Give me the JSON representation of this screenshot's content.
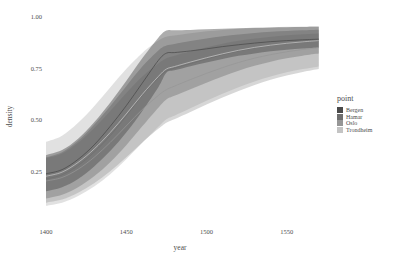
{
  "chart_data": {
    "type": "area",
    "title": "",
    "xlabel": "year",
    "ylabel": "density",
    "xlim": [
      1400,
      1572
    ],
    "ylim": [
      0.04,
      1.02
    ],
    "xticks": [
      1400,
      1450,
      1500,
      1550
    ],
    "xticklabels": [
      "1400",
      "1450",
      "1500",
      "1550"
    ],
    "yticks": [
      0.25,
      0.5,
      0.75,
      1.0
    ],
    "yticklabels": [
      "0.25",
      "0.50",
      "0.75",
      "1.00"
    ],
    "grid": false,
    "legend": {
      "title": "point",
      "position": "right",
      "entries": [
        {
          "label": "Bergen",
          "color": "#4a4a4a"
        },
        {
          "label": "Hamar",
          "color": "#6e6e6e"
        },
        {
          "label": "Oslo",
          "color": "#969696"
        },
        {
          "label": "Trondheim",
          "color": "#c4c4c4"
        }
      ]
    },
    "x": [
      1400,
      1410,
      1420,
      1430,
      1440,
      1450,
      1460,
      1470,
      1475,
      1480,
      1490,
      1500,
      1510,
      1520,
      1530,
      1540,
      1550,
      1560,
      1570
    ],
    "series": [
      {
        "name": "Bergen",
        "color": "#4a4a4a",
        "band_alpha": 0.45,
        "median": [
          0.24,
          0.26,
          0.31,
          0.38,
          0.47,
          0.57,
          0.68,
          0.79,
          0.825,
          0.828,
          0.836,
          0.846,
          0.857,
          0.866,
          0.874,
          0.881,
          0.886,
          0.89,
          0.893
        ],
        "lower": [
          0.155,
          0.175,
          0.215,
          0.275,
          0.35,
          0.44,
          0.545,
          0.66,
          0.73,
          0.742,
          0.762,
          0.78,
          0.797,
          0.812,
          0.824,
          0.834,
          0.842,
          0.848,
          0.853
        ],
        "upper": [
          0.33,
          0.355,
          0.41,
          0.49,
          0.585,
          0.69,
          0.8,
          0.9,
          0.935,
          0.936,
          0.938,
          0.941,
          0.944,
          0.946,
          0.948,
          0.95,
          0.951,
          0.952,
          0.953
        ]
      },
      {
        "name": "Hamar",
        "color": "#6e6e6e",
        "band_alpha": 0.4,
        "median": [
          0.215,
          0.235,
          0.28,
          0.345,
          0.425,
          0.52,
          0.62,
          0.705,
          0.738,
          0.752,
          0.775,
          0.797,
          0.818,
          0.836,
          0.851,
          0.863,
          0.872,
          0.879,
          0.885
        ],
        "lower": [
          0.12,
          0.138,
          0.175,
          0.228,
          0.296,
          0.378,
          0.47,
          0.56,
          0.6,
          0.618,
          0.65,
          0.682,
          0.712,
          0.74,
          0.764,
          0.784,
          0.8,
          0.813,
          0.823
        ],
        "upper": [
          0.32,
          0.345,
          0.4,
          0.478,
          0.568,
          0.665,
          0.76,
          0.838,
          0.862,
          0.87,
          0.884,
          0.896,
          0.907,
          0.916,
          0.923,
          0.929,
          0.933,
          0.936,
          0.939
        ]
      },
      {
        "name": "Oslo",
        "color": "#969696",
        "band_alpha": 0.38,
        "median": [
          0.205,
          0.222,
          0.262,
          0.32,
          0.392,
          0.472,
          0.552,
          0.62,
          0.648,
          0.665,
          0.697,
          0.727,
          0.755,
          0.78,
          0.801,
          0.818,
          0.832,
          0.843,
          0.852
        ],
        "lower": [
          0.1,
          0.115,
          0.148,
          0.194,
          0.252,
          0.32,
          0.392,
          0.458,
          0.488,
          0.505,
          0.54,
          0.576,
          0.61,
          0.642,
          0.671,
          0.696,
          0.717,
          0.734,
          0.748
        ],
        "upper": [
          0.315,
          0.338,
          0.39,
          0.462,
          0.545,
          0.632,
          0.712,
          0.775,
          0.8,
          0.812,
          0.834,
          0.854,
          0.871,
          0.885,
          0.896,
          0.905,
          0.912,
          0.917,
          0.921
        ]
      },
      {
        "name": "Trondheim",
        "color": "#c4c4c4",
        "band_alpha": 0.5,
        "median": [
          0.228,
          0.248,
          0.295,
          0.36,
          0.44,
          0.53,
          0.625,
          0.712,
          0.748,
          0.76,
          0.782,
          0.803,
          0.822,
          0.839,
          0.853,
          0.864,
          0.873,
          0.88,
          0.886
        ],
        "lower": [
          0.085,
          0.1,
          0.132,
          0.178,
          0.238,
          0.31,
          0.39,
          0.468,
          0.505,
          0.522,
          0.558,
          0.594,
          0.628,
          0.66,
          0.688,
          0.712,
          0.732,
          0.748,
          0.761
        ],
        "upper": [
          0.395,
          0.425,
          0.487,
          0.568,
          0.658,
          0.748,
          0.826,
          0.886,
          0.905,
          0.911,
          0.922,
          0.931,
          0.938,
          0.943,
          0.947,
          0.95,
          0.953,
          0.955,
          0.956
        ]
      }
    ]
  }
}
